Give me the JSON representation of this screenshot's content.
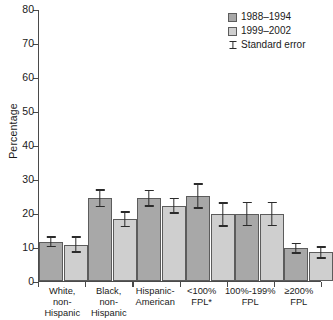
{
  "chart_data": {
    "type": "bar",
    "title": "",
    "xlabel": "",
    "ylabel": "Percentage",
    "ylim": [
      0,
      80
    ],
    "ytick_values": [
      0,
      10,
      20,
      30,
      40,
      50,
      60,
      70,
      80
    ],
    "ytick_labels": [
      "0",
      "10",
      "20",
      "30",
      "40",
      "50",
      "60",
      "70",
      "80"
    ],
    "grid": false,
    "legend_position": "top-right",
    "categories": [
      "White, non-\nHispanic",
      "Black, non-\nHispanic",
      "Hispanic-\nAmerican",
      "<100%\nFPL*",
      "100%-199%\nFPL",
      "≥200%\nFPL"
    ],
    "series": [
      {
        "name": "1988–1994",
        "color": "#a8a8a8",
        "values": [
          11.5,
          24.4,
          24.4,
          25.0,
          19.7,
          9.6
        ],
        "errors": [
          1.6,
          2.6,
          2.5,
          3.7,
          3.6,
          1.6
        ]
      },
      {
        "name": "1999–2002",
        "color": "#cfcfcf",
        "values": [
          10.7,
          18.2,
          22.1,
          19.6,
          19.7,
          8.4
        ],
        "errors": [
          2.4,
          2.3,
          2.3,
          3.6,
          3.6,
          1.8
        ]
      }
    ],
    "error_legend_label": "Standard error"
  },
  "legend": {
    "items": [
      {
        "label": "1988–1994",
        "swatch": "series-0"
      },
      {
        "label": "1999–2002",
        "swatch": "series-1"
      },
      {
        "label": "Standard error",
        "swatch": "error-bar"
      }
    ]
  }
}
